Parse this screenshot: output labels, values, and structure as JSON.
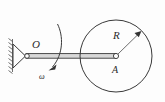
{
  "figure": {
    "background_color": "#fdfdfd",
    "line_color": "#3a3a3a",
    "labels": {
      "pivot": "O",
      "radius": "R",
      "disk_center": "A",
      "angular_velocity": "ω"
    },
    "icon_names": {
      "support": "pin-support-icon",
      "hatching": "ground-hatching-icon",
      "rod": "rigid-rod-icon",
      "disk": "disk-icon",
      "radius_arrow": "radius-arrow-icon",
      "rotation_arrow": "angular-velocity-arrow-icon",
      "pivot_joint": "pivot-joint-icon",
      "center_joint": "center-joint-icon"
    },
    "geometry": {
      "pivot_point": [
        26,
        56
      ],
      "disk_center": [
        116,
        56
      ],
      "disk_radius": 36,
      "radius_arrow_tip": [
        141,
        31
      ],
      "rod_length": 90
    }
  }
}
